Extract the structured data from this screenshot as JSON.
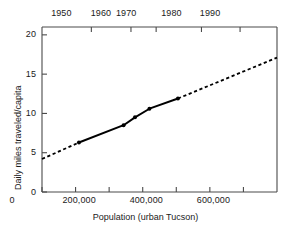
{
  "chart_data": {
    "type": "line",
    "title": "",
    "xlabel": "Population (urban Tucson)",
    "ylabel": "Daily miles traveled/capita",
    "xlim": [
      0,
      700000
    ],
    "ylim": [
      0,
      21
    ],
    "grid": false,
    "legend": null,
    "x_ticks": [
      {
        "value": 0,
        "label": "0"
      },
      {
        "value": 100000,
        "label": ""
      },
      {
        "value": 200000,
        "label": "200,000"
      },
      {
        "value": 300000,
        "label": ""
      },
      {
        "value": 400000,
        "label": "400,000"
      },
      {
        "value": 500000,
        "label": ""
      },
      {
        "value": 600000,
        "label": "600,000"
      }
    ],
    "y_ticks": [
      {
        "value": 0,
        "label": "0"
      },
      {
        "value": 5,
        "label": "5"
      },
      {
        "value": 10,
        "label": "10"
      },
      {
        "value": 15,
        "label": "15"
      },
      {
        "value": 20,
        "label": "20"
      }
    ],
    "secondary_x_axis": {
      "label": "",
      "ticks": [
        {
          "population": 147000,
          "label": "1950"
        },
        {
          "population": 265000,
          "label": "1960"
        },
        {
          "population": 340000,
          "label": "1970"
        },
        {
          "population": 475000,
          "label": "1980"
        },
        {
          "population": 590000,
          "label": "1990"
        }
      ]
    },
    "series": [
      {
        "name": "observed",
        "style": "solid",
        "markers": true,
        "points": [
          {
            "x": 110000,
            "y": 6.3
          },
          {
            "x": 243000,
            "y": 8.5
          },
          {
            "x": 277000,
            "y": 9.5
          },
          {
            "x": 320000,
            "y": 10.6
          },
          {
            "x": 405000,
            "y": 11.9
          }
        ]
      },
      {
        "name": "extrapolation-low",
        "style": "dashed",
        "markers": false,
        "points": [
          {
            "x": 0,
            "y": 4.2
          },
          {
            "x": 110000,
            "y": 6.3
          }
        ]
      },
      {
        "name": "extrapolation-high",
        "style": "dashed",
        "markers": false,
        "points": [
          {
            "x": 405000,
            "y": 11.9
          },
          {
            "x": 700000,
            "y": 17.1
          }
        ]
      }
    ]
  }
}
